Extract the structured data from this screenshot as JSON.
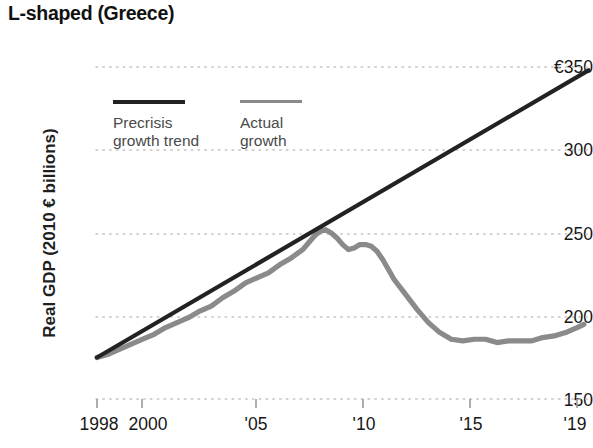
{
  "chart_title": "L-shaped (Greece)",
  "axes": {
    "y_title": "Real GDP (2010 € billions)",
    "y_ticks": [
      "€350",
      "300",
      "250",
      "200",
      "150"
    ],
    "x_ticks": [
      "1998",
      "2000",
      "'05",
      "'10",
      "'15",
      "'19"
    ]
  },
  "legend": {
    "items": [
      {
        "label": "Precrisis\ngrowth trend",
        "color": "#222222"
      },
      {
        "label": "Actual\ngrowth",
        "color": "#8a8a8a"
      }
    ]
  },
  "colors": {
    "trend": "#222222",
    "actual": "#8a8a8a",
    "grid": "#c9c9c9",
    "tick": "#9a9a9a",
    "text": "#171717"
  },
  "chart_data": {
    "type": "line",
    "title": "L-shaped (Greece)",
    "xlabel": "",
    "ylabel": "Real GDP (2010 € billions)",
    "xlim": [
      1998,
      2019.5
    ],
    "ylim": [
      150,
      350
    ],
    "yticks": [
      150,
      200,
      250,
      300,
      350
    ],
    "xticks": [
      1998,
      2000,
      2005,
      2010,
      2015,
      2019
    ],
    "grid": "horizontal-dotted",
    "legend_position": "inside-upper-left",
    "series": [
      {
        "name": "Precrisis growth trend",
        "color": "#222222",
        "style": "straight-line",
        "x": [
          1998,
          2019.5
        ],
        "values": [
          175,
          348
        ]
      },
      {
        "name": "Actual growth",
        "color": "#8a8a8a",
        "style": "quarterly-wiggle",
        "x": [
          1998.0,
          1998.5,
          1999.0,
          1999.5,
          2000.0,
          2000.5,
          2001.0,
          2001.5,
          2002.0,
          2002.5,
          2003.0,
          2003.5,
          2004.0,
          2004.5,
          2005.0,
          2005.5,
          2006.0,
          2006.5,
          2007.0,
          2007.25,
          2007.5,
          2007.75,
          2008.0,
          2008.25,
          2008.5,
          2008.75,
          2009.0,
          2009.25,
          2009.5,
          2009.75,
          2010.0,
          2010.25,
          2010.5,
          2010.75,
          2011.0,
          2011.5,
          2012.0,
          2012.5,
          2013.0,
          2013.5,
          2014.0,
          2014.5,
          2015.0,
          2015.5,
          2016.0,
          2016.5,
          2017.0,
          2017.5,
          2018.0,
          2018.5,
          2019.0,
          2019.3
        ],
        "values": [
          175,
          177,
          180,
          183,
          186,
          189,
          193,
          196,
          199,
          203,
          206,
          211,
          215,
          220,
          223,
          226,
          231,
          235,
          240,
          244,
          248,
          251,
          252,
          250,
          247,
          243,
          240,
          241,
          243,
          243,
          242,
          239,
          234,
          228,
          222,
          213,
          204,
          196,
          190,
          186,
          185,
          186,
          186,
          184,
          185,
          185,
          185,
          187,
          188,
          190,
          193,
          195
        ]
      }
    ],
    "annotations": [
      {
        "text": "peak",
        "x": 2007.75,
        "y": 252
      },
      {
        "text": "trough plateau",
        "x": 2014.0,
        "y": 185
      }
    ]
  }
}
